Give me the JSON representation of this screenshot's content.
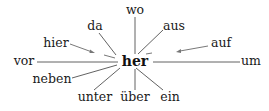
{
  "diagram": {
    "center": {
      "label": "her",
      "x": 135,
      "y": 61
    },
    "words": [
      {
        "id": "wo",
        "label": "wo",
        "x": 135,
        "y": 10
      },
      {
        "id": "da",
        "label": "da",
        "x": 95,
        "y": 27
      },
      {
        "id": "aus",
        "label": "aus",
        "x": 172,
        "y": 27
      },
      {
        "id": "hier",
        "label": "hier",
        "x": 56,
        "y": 44
      },
      {
        "id": "auf",
        "label": "auf",
        "x": 220,
        "y": 44
      },
      {
        "id": "vor",
        "label": "vor",
        "x": 27,
        "y": 62
      },
      {
        "id": "um",
        "label": "um",
        "x": 251,
        "y": 62
      },
      {
        "id": "neben",
        "label": "neben",
        "x": 51,
        "y": 80
      },
      {
        "id": "unter",
        "label": "unter",
        "x": 95,
        "y": 98
      },
      {
        "id": "ueber",
        "label": "über",
        "x": 135,
        "y": 98
      },
      {
        "id": "ein",
        "label": "ein",
        "x": 172,
        "y": 98
      }
    ],
    "connectors": [
      {
        "to": "wo",
        "type": "line"
      },
      {
        "to": "da",
        "type": "line"
      },
      {
        "to": "aus",
        "type": "line"
      },
      {
        "to": "hier",
        "type": "arrow-short"
      },
      {
        "to": "auf",
        "type": "arrow-short"
      },
      {
        "to": "vor",
        "type": "line"
      },
      {
        "to": "um",
        "type": "line"
      },
      {
        "to": "neben",
        "type": "line"
      },
      {
        "to": "unter",
        "type": "line"
      },
      {
        "to": "ueber",
        "type": "line"
      },
      {
        "to": "ein",
        "type": "line"
      }
    ]
  }
}
